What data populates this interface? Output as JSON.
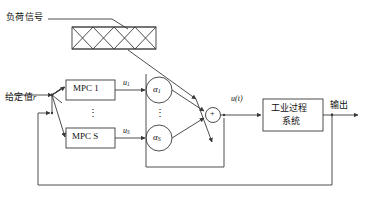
{
  "diagram": {
    "colors": {
      "stroke": "#3a3a3a",
      "text": "#111111",
      "background": "#ffffff"
    },
    "labels": {
      "load_signal": "负荷信号",
      "setpoint": "给定值",
      "setpoint_var": "r",
      "output": "输出",
      "process_line1": "工业过程",
      "process_line2": "系统",
      "mpc_first": "MPC 1",
      "mpc_last": "MPC S",
      "alpha_first_base": "α",
      "alpha_first_sub": "1",
      "alpha_last_base": "α",
      "alpha_last_sub": "S",
      "u_first_base": "u",
      "u_first_sub": "1",
      "u_last_base": "u",
      "u_last_sub": "S",
      "control_signal_base": "u",
      "control_signal_arg": "(t)",
      "sum_symbol": "+",
      "vdots_mpc": "⋮",
      "vdots_alpha": "⋮"
    },
    "blocks": [
      {
        "name": "scheduler-network",
        "kind": "crosshatch-box",
        "cells": 4
      },
      {
        "name": "mpc-1",
        "kind": "rect",
        "label": "MPC 1"
      },
      {
        "name": "mpc-s",
        "kind": "rect",
        "label": "MPC S"
      },
      {
        "name": "alpha-1",
        "kind": "circle",
        "label": "α1"
      },
      {
        "name": "alpha-s",
        "kind": "circle",
        "label": "αS"
      },
      {
        "name": "summing-junction",
        "kind": "circle",
        "label": "+"
      },
      {
        "name": "industrial-process",
        "kind": "rect",
        "label": "工业过程系统"
      }
    ],
    "signals": [
      {
        "name": "load-signal-to-network",
        "label": "负荷信号"
      },
      {
        "name": "setpoint-in",
        "label": "给定值r"
      },
      {
        "name": "mpc1-out",
        "label": "u1"
      },
      {
        "name": "mpcs-out",
        "label": "uS"
      },
      {
        "name": "sum-out",
        "label": "u(t)"
      },
      {
        "name": "process-out",
        "label": "输出"
      }
    ]
  }
}
